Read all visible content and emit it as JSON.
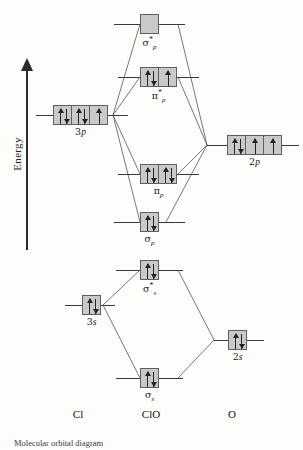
{
  "figure": {
    "energy_axis_label": "Energy",
    "caption": "Molecular orbital diagram"
  },
  "axis_labels": [
    {
      "name": "left-atom",
      "text": "Cl",
      "x": 78
    },
    {
      "name": "molecule",
      "text": "ClO",
      "x": 151
    },
    {
      "name": "right-atom",
      "text": "O",
      "x": 232
    }
  ],
  "levels": [
    {
      "id": "sigma-p-antibonding",
      "label_main": "σ",
      "label_sub": "p",
      "label_star": "*",
      "column": "center",
      "x": 140,
      "y": 14,
      "boxes": [
        {
          "electrons": "none"
        }
      ],
      "stub_left": 26,
      "stub_right": 26
    },
    {
      "id": "pi-p-antibonding",
      "label_main": "π",
      "label_sub": "p",
      "label_star": "*",
      "column": "center",
      "x": 140,
      "y": 67,
      "boxes": [
        {
          "electrons": "pair"
        },
        {
          "electrons": "single"
        }
      ],
      "stub_left": 22,
      "stub_right": 22
    },
    {
      "id": "pi-p-bonding",
      "label_main": "π",
      "label_sub": "p",
      "label_star": "",
      "column": "center",
      "x": 140,
      "y": 164,
      "boxes": [
        {
          "electrons": "pair"
        },
        {
          "electrons": "pair"
        }
      ],
      "stub_left": 22,
      "stub_right": 22
    },
    {
      "id": "sigma-p-bonding",
      "label_main": "σ",
      "label_sub": "p",
      "label_star": "",
      "column": "center",
      "x": 140,
      "y": 212,
      "boxes": [
        {
          "electrons": "pair"
        }
      ],
      "stub_left": 26,
      "stub_right": 26
    },
    {
      "id": "sigma-s-antibonding",
      "label_main": "σ",
      "label_sub": "s",
      "label_star": "*",
      "column": "center",
      "x": 140,
      "y": 260,
      "boxes": [
        {
          "electrons": "pair"
        }
      ],
      "stub_left": 24,
      "stub_right": 24
    },
    {
      "id": "sigma-s-bonding",
      "label_main": "σ",
      "label_sub": "s",
      "label_star": "",
      "column": "center",
      "x": 140,
      "y": 368,
      "boxes": [
        {
          "electrons": "pair"
        }
      ],
      "stub_left": 24,
      "stub_right": 24
    },
    {
      "id": "cl-3p",
      "label_main": "3",
      "label_sub": "",
      "label_star": "",
      "label_italic_tail": "p",
      "column": "left",
      "x": 53,
      "y": 105,
      "boxes": [
        {
          "electrons": "pair"
        },
        {
          "electrons": "pair"
        },
        {
          "electrons": "single"
        }
      ],
      "stub_left": 17,
      "stub_right": 20
    },
    {
      "id": "cl-3s",
      "label_main": "3",
      "label_sub": "",
      "label_star": "",
      "label_italic_tail": "s",
      "column": "left",
      "x": 82,
      "y": 295,
      "boxes": [
        {
          "electrons": "pair"
        }
      ],
      "stub_left": 17,
      "stub_right": 14
    },
    {
      "id": "o-2p",
      "label_main": "2",
      "label_sub": "",
      "label_star": "",
      "label_italic_tail": "p",
      "column": "right",
      "x": 227,
      "y": 135,
      "boxes": [
        {
          "electrons": "pair"
        },
        {
          "electrons": "single"
        },
        {
          "electrons": "single"
        }
      ],
      "stub_left": 20,
      "stub_right": 17
    },
    {
      "id": "o-2s",
      "label_main": "2",
      "label_sub": "",
      "label_star": "",
      "label_italic_tail": "s",
      "column": "right",
      "x": 228,
      "y": 330,
      "boxes": [
        {
          "electrons": "pair"
        }
      ],
      "stub_left": 14,
      "stub_right": 17
    }
  ],
  "connectors": [
    {
      "name": "cl3p-to-sigmap-star",
      "d": "M 113,115 L 140,24"
    },
    {
      "name": "cl3p-to-pip-star",
      "d": "M 113,115 L 140,77"
    },
    {
      "name": "cl3p-to-pip",
      "d": "M 113,115 L 140,174"
    },
    {
      "name": "cl3p-to-sigmap",
      "d": "M 113,115 L 140,222"
    },
    {
      "name": "o2p-to-sigmap-star",
      "d": "M 207,145 L 178,24"
    },
    {
      "name": "o2p-to-pip-star",
      "d": "M 207,145 L 178,77"
    },
    {
      "name": "o2p-to-pip",
      "d": "M 207,145 L 178,174"
    },
    {
      "name": "o2p-to-sigmap",
      "d": "M 207,145 L 166,222"
    },
    {
      "name": "cl3s-to-sigmas-star",
      "d": "M 103,305 L 140,270"
    },
    {
      "name": "cl3s-to-sigmas",
      "d": "M 103,305 L 140,378"
    },
    {
      "name": "o2s-to-sigmas-star",
      "d": "M 214,340 L 178,270"
    },
    {
      "name": "o2s-to-sigmas",
      "d": "M 214,340 L 178,378"
    }
  ]
}
